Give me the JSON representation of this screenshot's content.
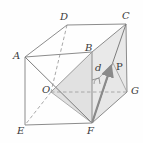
{
  "figure": {
    "type": "geometry-diagram",
    "shape": "cube",
    "stroke_color": "#8c8c8c",
    "hidden_stroke_color": "#a8a8a8",
    "fill_color": "#d9d9d9",
    "label_color": "#3a3a3a",
    "background": "#fefefe"
  },
  "labels": {
    "A": "A",
    "B": "B",
    "C": "C",
    "D": "D",
    "E": "E",
    "F": "F",
    "G": "G",
    "O": "O",
    "P": "P",
    "d": "d"
  },
  "vertices": {
    "A": [
      25,
      57
    ],
    "B": [
      92,
      52
    ],
    "C": [
      126,
      24
    ],
    "D": [
      67,
      25
    ],
    "E": [
      25,
      125
    ],
    "F": [
      92,
      123
    ],
    "G": [
      127,
      92
    ],
    "O": [
      51,
      92
    ],
    "P_arrow_tip": [
      113,
      63
    ],
    "P_label": [
      117,
      64
    ]
  },
  "marks": {
    "right_angle": "right-angle-mark-at-F-base",
    "arrow": "vector-d-from-F-to-P"
  }
}
